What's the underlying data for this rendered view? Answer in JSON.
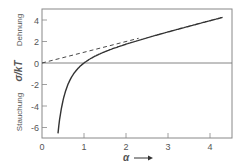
{
  "chart_data": {
    "type": "line",
    "title": "",
    "xlabel": "α",
    "ylabel": "σ/kT",
    "ylabel_upper": "Dehnung",
    "ylabel_lower": "Stauchung",
    "xlim": [
      0,
      4.5
    ],
    "ylim": [
      -7,
      5
    ],
    "x_ticks": [
      0,
      1,
      2,
      3,
      4
    ],
    "x_tick_labels": [
      "0",
      "1",
      "2",
      "3",
      "4"
    ],
    "y_ticks": [
      -6,
      -4,
      -2,
      0,
      2,
      4
    ],
    "y_tick_labels": [
      "-6",
      "-4",
      "-2",
      "0",
      "2",
      "4"
    ],
    "grid": false,
    "series": [
      {
        "name": "σ/kT = α − 1/α²",
        "style": "solid",
        "x": [
          0.38,
          0.45,
          0.5,
          0.6,
          0.7,
          0.8,
          0.9,
          1.0,
          1.2,
          1.5,
          2.0,
          2.5,
          3.0,
          3.5,
          4.0,
          4.3
        ],
        "values": [
          -6.55,
          -4.49,
          -3.5,
          -2.18,
          -1.34,
          -0.76,
          -0.33,
          0,
          0.51,
          1.06,
          1.75,
          2.34,
          2.89,
          3.42,
          3.94,
          4.25
        ]
      },
      {
        "name": "σ/kT = α (asymptote)",
        "style": "dashed",
        "x": [
          0,
          2.3
        ],
        "values": [
          0,
          2.3
        ]
      }
    ]
  }
}
